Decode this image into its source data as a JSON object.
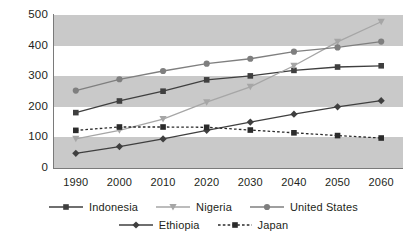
{
  "chart_data": {
    "type": "line",
    "title": "",
    "subtitle": "",
    "xlabel": "",
    "ylabel": "",
    "x": [
      1990,
      2000,
      2010,
      2020,
      2030,
      2040,
      2050,
      2060
    ],
    "categories": [
      "1990",
      "2000",
      "2010",
      "2020",
      "2030",
      "2040",
      "2050",
      "2060"
    ],
    "ylim": [
      0,
      500
    ],
    "yticks": [
      0,
      100,
      200,
      300,
      400,
      500
    ],
    "ytick_labels": [
      "0",
      "100",
      "200",
      "300",
      "400",
      "500"
    ],
    "grid": false,
    "banded_background": true,
    "legend_position": "bottom",
    "series": [
      {
        "name": "Indonesia",
        "values": [
          181,
          219,
          251,
          288,
          301,
          319,
          330,
          334
        ],
        "color": "#3f3f3f",
        "marker": "square",
        "line_style": "solid"
      },
      {
        "name": "Nigeria",
        "values": [
          95,
          123,
          160,
          215,
          265,
          334,
          412,
          478
        ],
        "color": "#a6a6a6",
        "marker": "triangle-down",
        "line_style": "solid"
      },
      {
        "name": "United States",
        "values": [
          253,
          290,
          317,
          341,
          357,
          380,
          394,
          413
        ],
        "color": "#7f7f7f",
        "marker": "circle",
        "line_style": "solid"
      },
      {
        "name": "Ethiopia",
        "values": [
          48,
          70,
          95,
          123,
          150,
          176,
          200,
          220
        ],
        "color": "#3f3f3f",
        "marker": "diamond",
        "line_style": "solid"
      },
      {
        "name": "Japan",
        "values": [
          123,
          134,
          134,
          133,
          124,
          115,
          106,
          98
        ],
        "color": "#2b2b2b",
        "marker": "square",
        "line_style": "dashed"
      }
    ],
    "bands": [
      {
        "from": 0,
        "to": 100,
        "fill": "#c9c9c9"
      },
      {
        "from": 100,
        "to": 200,
        "fill": "#ffffff"
      },
      {
        "from": 200,
        "to": 300,
        "fill": "#c9c9c9"
      },
      {
        "from": 300,
        "to": 400,
        "fill": "#ffffff"
      },
      {
        "from": 400,
        "to": 500,
        "fill": "#c9c9c9"
      }
    ],
    "axis_color": "#7a7a7a",
    "text_color": "#231f20"
  },
  "legend": {
    "rows": [
      [
        "Indonesia",
        "Nigeria",
        "United States"
      ],
      [
        "Ethiopia",
        "Japan"
      ]
    ]
  }
}
